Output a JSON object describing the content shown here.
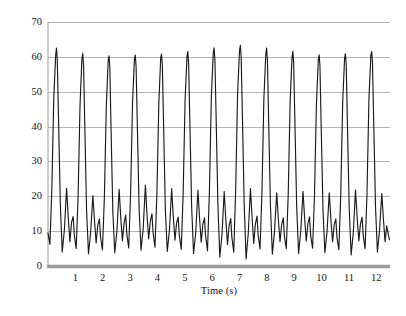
{
  "chart_data": {
    "type": "line",
    "title": "",
    "subtitle": "",
    "xlabel": "Time (s)",
    "ylabel": "Knee joint angle (°)",
    "xlim": [
      0,
      12.5
    ],
    "ylim": [
      0,
      70
    ],
    "grid": true,
    "grid_axis": "y",
    "legend": "none",
    "x_ticks": [
      1,
      2,
      3,
      4,
      5,
      6,
      7,
      8,
      9,
      10,
      11,
      12
    ],
    "x_tick_labels": [
      "1",
      "2",
      "3",
      "4",
      "5",
      "6",
      "7",
      "8",
      "9",
      "10",
      "11",
      "12"
    ],
    "y_ticks": [
      0,
      10,
      20,
      30,
      40,
      50,
      60,
      70
    ],
    "y_tick_labels": [
      "0",
      "10",
      "20",
      "30",
      "40",
      "50",
      "60",
      "70"
    ],
    "line_color": "#1a1a1a",
    "grid_color": "#b4b4b4",
    "axis_color": "#9a9a9a",
    "series": [
      {
        "name": "Knee joint angle",
        "units": "degrees",
        "cycle_count": 13,
        "cycle_period_s": 0.96,
        "peak_values": [
          62.5,
          61.0,
          60.3,
          60.5,
          60.8,
          61.5,
          62.6,
          63.3,
          62.5,
          61.6,
          60.6,
          60.9,
          61.5
        ],
        "secondary_bump_values": [
          22.3,
          20.2,
          22.0,
          23.2,
          22.2,
          21.8,
          21.4,
          22.2,
          21.0,
          21.4,
          21.0,
          21.8
        ],
        "tertiary_bump_values": [
          14.2,
          13.5,
          14.6,
          15.0,
          14.0,
          13.8,
          13.6,
          14.3,
          13.8,
          14.1,
          13.5,
          14.0
        ],
        "trough_values": [
          4.0,
          3.5,
          3.8,
          4.5,
          4.2,
          3.6,
          2.5,
          2.0,
          3.4,
          3.6,
          3.8,
          3.2
        ],
        "x": [
          0.0,
          0.07,
          0.14,
          0.21,
          0.28,
          0.31,
          0.34,
          0.38,
          0.45,
          0.52,
          0.6,
          0.68,
          0.74,
          0.8,
          0.86,
          0.92,
          0.96,
          1.03,
          1.1,
          1.17,
          1.24,
          1.27,
          1.3,
          1.34,
          1.41,
          1.48,
          1.56,
          1.64,
          1.7,
          1.76,
          1.82,
          1.88,
          1.92,
          1.99,
          2.06,
          2.13,
          2.2,
          2.23,
          2.26,
          2.3,
          2.37,
          2.44,
          2.52,
          2.6,
          2.66,
          2.72,
          2.78,
          2.84,
          2.88,
          2.95,
          3.02,
          3.09,
          3.16,
          3.19,
          3.22,
          3.26,
          3.33,
          3.4,
          3.48,
          3.56,
          3.62,
          3.68,
          3.74,
          3.8,
          3.84,
          3.91,
          3.98,
          4.05,
          4.12,
          4.15,
          4.18,
          4.22,
          4.29,
          4.36,
          4.44,
          4.52,
          4.58,
          4.64,
          4.7,
          4.76,
          4.8,
          4.87,
          4.94,
          5.01,
          5.08,
          5.11,
          5.14,
          5.18,
          5.25,
          5.32,
          5.4,
          5.48,
          5.54,
          5.6,
          5.66,
          5.72,
          5.76,
          5.83,
          5.9,
          5.97,
          6.04,
          6.07,
          6.1,
          6.14,
          6.21,
          6.28,
          6.36,
          6.44,
          6.5,
          6.56,
          6.62,
          6.68,
          6.72,
          6.79,
          6.86,
          6.93,
          7.0,
          7.03,
          7.06,
          7.1,
          7.17,
          7.24,
          7.32,
          7.4,
          7.46,
          7.52,
          7.58,
          7.64,
          7.68,
          7.75,
          7.82,
          7.89,
          7.96,
          7.99,
          8.02,
          8.06,
          8.13,
          8.2,
          8.28,
          8.36,
          8.42,
          8.48,
          8.54,
          8.6,
          8.64,
          8.71,
          8.78,
          8.85,
          8.92,
          8.95,
          8.98,
          9.02,
          9.09,
          9.16,
          9.24,
          9.32,
          9.38,
          9.44,
          9.5,
          9.56,
          9.6,
          9.67,
          9.74,
          9.81,
          9.88,
          9.91,
          9.94,
          9.98,
          10.05,
          10.12,
          10.2,
          10.28,
          10.34,
          10.4,
          10.46,
          10.52,
          10.56,
          10.63,
          10.7,
          10.77,
          10.84,
          10.87,
          10.9,
          10.94,
          11.01,
          11.08,
          11.16,
          11.24,
          11.3,
          11.36,
          11.42,
          11.48,
          11.52,
          11.59,
          11.66,
          11.73,
          11.8,
          11.83,
          11.86,
          11.9,
          11.97,
          12.04,
          12.12,
          12.2,
          12.26,
          12.32,
          12.38,
          12.44,
          12.48
        ],
        "y": [
          9.5,
          6.2,
          22.0,
          48.0,
          60.5,
          62.5,
          59.0,
          44.0,
          18.0,
          4.0,
          10.5,
          22.3,
          14.0,
          7.0,
          12.5,
          14.2,
          9.0,
          5.0,
          20.0,
          46.0,
          59.5,
          61.0,
          57.5,
          42.0,
          16.0,
          3.5,
          9.8,
          20.2,
          13.0,
          6.6,
          11.8,
          13.5,
          8.4,
          4.6,
          19.5,
          45.5,
          59.0,
          60.3,
          57.0,
          41.0,
          15.5,
          3.8,
          10.2,
          22.0,
          13.8,
          7.2,
          12.2,
          14.6,
          9.2,
          5.2,
          21.0,
          47.0,
          59.5,
          60.5,
          57.2,
          42.5,
          16.5,
          4.5,
          10.8,
          23.2,
          14.5,
          7.8,
          12.8,
          15.0,
          9.6,
          5.4,
          20.5,
          46.5,
          59.8,
          60.8,
          57.6,
          42.0,
          16.0,
          4.2,
          10.4,
          22.2,
          14.0,
          7.4,
          12.4,
          14.0,
          8.8,
          4.8,
          20.8,
          47.5,
          60.2,
          61.5,
          58.0,
          43.0,
          17.0,
          3.6,
          9.6,
          21.8,
          13.6,
          6.8,
          12.0,
          13.8,
          8.6,
          4.4,
          21.5,
          48.5,
          61.0,
          62.6,
          59.2,
          44.5,
          17.5,
          2.5,
          9.2,
          21.4,
          13.2,
          6.2,
          11.6,
          13.6,
          8.2,
          4.0,
          22.0,
          49.5,
          61.8,
          63.3,
          60.0,
          45.0,
          18.0,
          2.0,
          9.4,
          22.2,
          13.9,
          6.5,
          12.1,
          14.3,
          8.9,
          4.9,
          21.2,
          48.0,
          60.8,
          62.5,
          59.0,
          43.5,
          17.2,
          3.4,
          10.0,
          21.0,
          13.4,
          7.0,
          11.9,
          13.8,
          8.5,
          5.0,
          20.6,
          47.2,
          60.0,
          61.6,
          58.2,
          42.8,
          16.8,
          3.6,
          10.2,
          21.4,
          13.7,
          7.1,
          12.2,
          14.1,
          8.7,
          5.1,
          20.2,
          46.2,
          59.2,
          60.6,
          57.4,
          41.8,
          16.2,
          3.8,
          10.0,
          21.0,
          13.3,
          6.9,
          11.8,
          13.5,
          8.3,
          4.7,
          20.4,
          46.8,
          59.6,
          60.9,
          57.8,
          42.2,
          16.4,
          3.2,
          9.8,
          21.8,
          13.8,
          7.2,
          12.0,
          14.0,
          8.8,
          5.0,
          21.0,
          47.8,
          60.4,
          61.5,
          58.4,
          43.0,
          17.0,
          4.0,
          10.4,
          20.8,
          13.5,
          7.0,
          11.5,
          9.0,
          7.5
        ]
      }
    ]
  },
  "axes": {
    "plot_left_px": 48,
    "plot_right_px": 390,
    "plot_top_px": 22,
    "plot_bottom_px": 266
  }
}
